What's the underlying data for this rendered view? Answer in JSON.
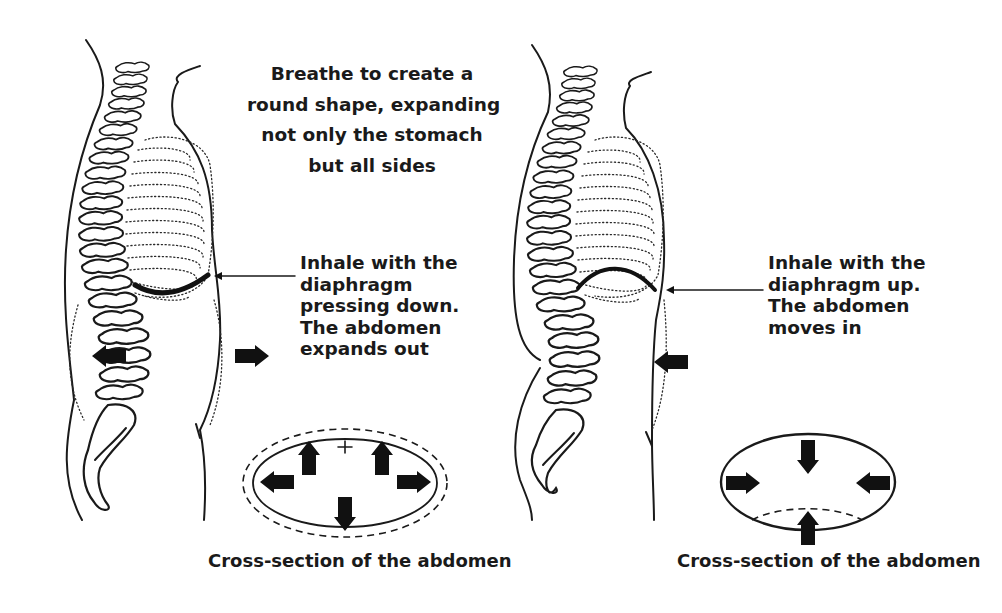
{
  "title": {
    "lines": [
      "Breathe to create a",
      "round shape, expanding",
      "not only the stomach",
      "but all sides"
    ]
  },
  "left_figure": {
    "label": "abdominal-breathing",
    "note_lines": [
      "Inhale with the",
      "diaphragm",
      "pressing down.",
      "The abdomen",
      "expands out"
    ],
    "diaphragm_state": "down",
    "abdomen_motion": "out",
    "caption": "Cross-section of the abdomen",
    "cross_section": {
      "outline": "solid ellipse inside dashed expanded ellipse",
      "arrows": [
        "up-left",
        "up-right",
        "left",
        "right",
        "down"
      ],
      "arrow_direction": "outward"
    }
  },
  "right_figure": {
    "label": "reverse-breathing",
    "note_lines": [
      "Inhale with the",
      "diaphragm up.",
      "The abdomen",
      "moves in"
    ],
    "diaphragm_state": "up",
    "abdomen_motion": "in",
    "caption": "Cross-section of the abdomen",
    "cross_section": {
      "outline": "solid ellipse with dashed inner arc at bottom",
      "arrows": [
        "top",
        "left",
        "right",
        "bottom"
      ],
      "arrow_direction": "inward"
    }
  },
  "colors": {
    "ink": "#1a1a1a",
    "background": "#ffffff"
  }
}
